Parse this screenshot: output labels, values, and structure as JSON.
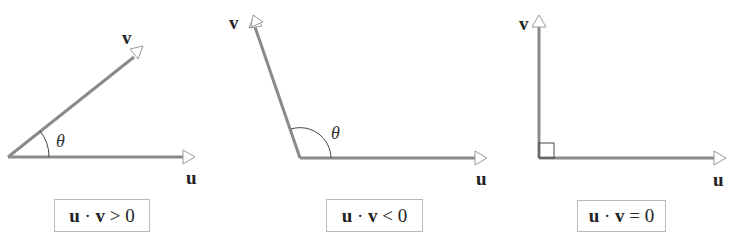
{
  "panels": [
    {
      "id": "acute",
      "vector_u_label": "u",
      "vector_v_label": "v",
      "angle_label": "θ",
      "formula": {
        "lhs_u": "u",
        "dot": "·",
        "lhs_v": "v",
        "relation": ">",
        "rhs": "0"
      },
      "angle_type": "acute"
    },
    {
      "id": "obtuse",
      "vector_u_label": "u",
      "vector_v_label": "v",
      "angle_label": "θ",
      "formula": {
        "lhs_u": "u",
        "dot": "·",
        "lhs_v": "v",
        "relation": "<",
        "rhs": "0"
      },
      "angle_type": "obtuse"
    },
    {
      "id": "right",
      "vector_u_label": "u",
      "vector_v_label": "v",
      "angle_label": "",
      "formula": {
        "lhs_u": "u",
        "dot": "·",
        "lhs_v": "v",
        "relation": "=",
        "rhs": "0"
      },
      "angle_type": "right"
    }
  ],
  "colors": {
    "vector": "#8a8a8a",
    "arrowhead_stroke": "#9a9a9a",
    "angle_arc": "#444444",
    "box_border": "#b8b8b8",
    "text": "#222222"
  }
}
